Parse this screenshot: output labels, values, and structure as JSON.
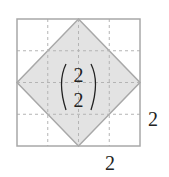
{
  "diagram": {
    "type": "grid-with-inscribed-diamond",
    "grid": {
      "rows": 4,
      "cols": 4,
      "line_style": "dashed"
    },
    "outer_square": {
      "x": 17,
      "y": 19,
      "width": 123,
      "height": 127
    },
    "diamond": {
      "fill": "#e3e3e3",
      "stroke": "#a8a8a8"
    },
    "vector": {
      "top": "2",
      "bottom": "2"
    },
    "labels": {
      "side": "2",
      "bottom": "2"
    },
    "colors": {
      "border": "#a8a8a8",
      "grid": "#b4b4b4",
      "text": "#222222"
    }
  }
}
